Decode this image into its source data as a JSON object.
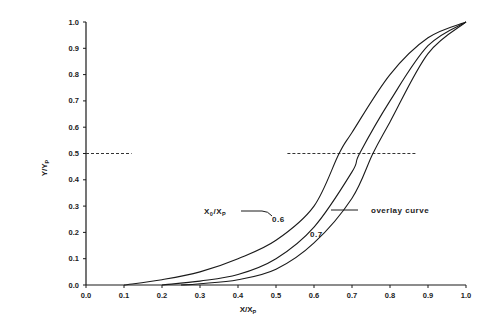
{
  "chart_data": {
    "type": "line",
    "title": "",
    "xlabel": "X/Xp",
    "ylabel": "Y/Yp",
    "xlim": [
      0.0,
      1.0
    ],
    "ylim": [
      0.0,
      1.0
    ],
    "grid": false,
    "x_ticks": [
      "0.0",
      "0.1",
      "0.2",
      "0.3",
      "0.4",
      "0.5",
      "0.6",
      "0.7",
      "0.8",
      "0.9",
      "1.0"
    ],
    "y_ticks": [
      "0.0",
      "0.1",
      "0.2",
      "0.3",
      "0.4",
      "0.5",
      "0.6",
      "0.7",
      "0.8",
      "0.9",
      "1.0"
    ],
    "series": [
      {
        "name": "0.6",
        "x": [
          0.1,
          0.2,
          0.3,
          0.4,
          0.5,
          0.6,
          0.666,
          0.7,
          0.8,
          0.9,
          1.0
        ],
        "y": [
          0.0,
          0.02,
          0.05,
          0.1,
          0.17,
          0.3,
          0.5,
          0.58,
          0.8,
          0.94,
          1.0
        ]
      },
      {
        "name": "overlay curve",
        "x": [
          0.2,
          0.3,
          0.4,
          0.5,
          0.6,
          0.7,
          0.72,
          0.8,
          0.9,
          1.0
        ],
        "y": [
          0.0,
          0.015,
          0.04,
          0.1,
          0.22,
          0.43,
          0.5,
          0.7,
          0.91,
          1.0
        ]
      },
      {
        "name": "0.7",
        "x": [
          0.25,
          0.3,
          0.4,
          0.5,
          0.6,
          0.7,
          0.755,
          0.8,
          0.9,
          1.0
        ],
        "y": [
          0.0,
          0.005,
          0.02,
          0.06,
          0.16,
          0.33,
          0.5,
          0.62,
          0.88,
          1.0
        ]
      }
    ],
    "reference_lines": [
      {
        "type": "dashed-horizontal",
        "y": 0.5,
        "x_range": [
          0.0,
          0.12
        ]
      },
      {
        "type": "dashed-horizontal",
        "y": 0.5,
        "x_range": [
          0.53,
          0.87
        ]
      }
    ],
    "annotations": [
      {
        "text": "X0/Xp",
        "x": 0.33,
        "y": 0.265,
        "points_to": "0.6 curve"
      },
      {
        "text": "0.6",
        "x": 0.57,
        "y": 0.24
      },
      {
        "text": "0.7",
        "x": 0.61,
        "y": 0.2
      },
      {
        "text": "overlay curve",
        "x": 0.81,
        "y": 0.28,
        "points_to": "middle curve"
      }
    ]
  },
  "labels": {
    "xlabel_main": "X/X",
    "xlabel_sub": "P",
    "ylabel_main": "Y/Y",
    "ylabel_sub": "P",
    "anno_param_main": "X",
    "anno_param_sub1": "0",
    "anno_param_mid": "/X",
    "anno_param_sub2": "P",
    "anno_06": "0.6",
    "anno_07": "0.7",
    "anno_overlay": "overlay curve"
  }
}
